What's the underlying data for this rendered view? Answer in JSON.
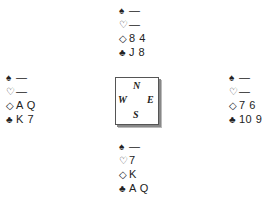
{
  "suits": {
    "spades": "♠",
    "hearts": "♡",
    "diamonds": "◇",
    "clubs": "♣"
  },
  "hands": {
    "north": {
      "spades": "—",
      "hearts": "—",
      "diamonds": "8 4",
      "clubs": "J 8"
    },
    "west": {
      "spades": "—",
      "hearts": "—",
      "diamonds": "A Q",
      "clubs": "K 7"
    },
    "east": {
      "spades": "—",
      "hearts": "—",
      "diamonds": "7 6",
      "clubs": "10 9"
    },
    "south": {
      "spades": "—",
      "hearts": "7",
      "diamonds": "K",
      "clubs": "A Q"
    }
  },
  "compass": {
    "north": "N",
    "west": "W",
    "east": "E",
    "south": "S"
  }
}
